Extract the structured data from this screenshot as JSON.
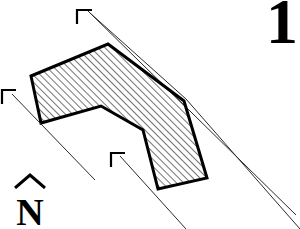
{
  "figure": {
    "number_label": "1",
    "normal_vector_label": "N",
    "normal_vector_hat_icon": "circumflex-hat-icon",
    "background_color": "#ffffff",
    "ink_color": "#000000",
    "outline_color": "#000000",
    "hatch_color": "#000000",
    "guide_line_color": "#333333",
    "shape": {
      "name": "hatched-chevron-polygon",
      "fill_pattern": "diagonal-hatch-45deg",
      "outline_width_px": 3,
      "vertices": [
        [
          31,
          76
        ],
        [
          108,
          44
        ],
        [
          184,
          101
        ],
        [
          207,
          178
        ],
        [
          158,
          189
        ],
        [
          143,
          130
        ],
        [
          101,
          106
        ],
        [
          41,
          123
        ]
      ]
    },
    "arrows": [
      {
        "name": "normal-arrow-top",
        "tip": [
          88,
          11
        ],
        "tail": [
          186,
          97
        ],
        "arrowhead_style": "open-corner"
      },
      {
        "name": "normal-arrow-left",
        "tip": [
          10,
          92
        ],
        "tail": [
          95,
          180
        ],
        "arrowhead_style": "open-corner"
      },
      {
        "name": "normal-arrow-bottom",
        "tip": [
          118,
          154
        ],
        "tail": [
          186,
          229
        ],
        "arrowhead_style": "open-corner"
      }
    ],
    "guide_lines": [
      {
        "name": "guide-line-top-right",
        "from": [
          88,
          11
        ],
        "to": [
          296,
          215
        ]
      },
      {
        "name": "guide-line-lower-right",
        "from": [
          186,
          101
        ],
        "to": [
          299,
          229
        ]
      }
    ]
  }
}
